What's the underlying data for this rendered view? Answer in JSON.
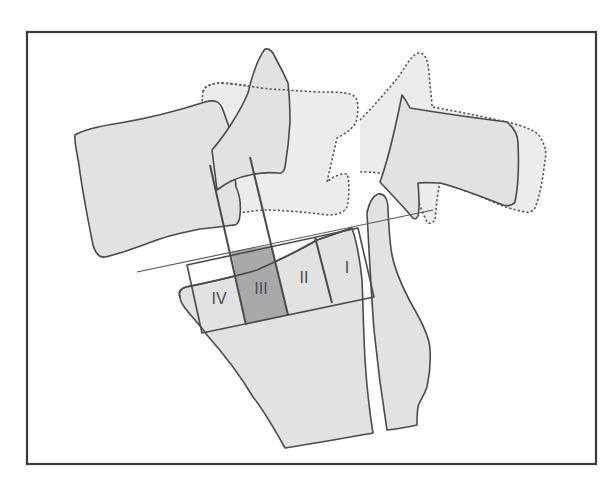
{
  "figure": {
    "type": "anatomical-diagram",
    "colors": {
      "frame": "#3a3a3a",
      "bone_fill": "#e2e2e2",
      "ghost_fill": "#ececec",
      "outline": "#4a4a4a",
      "highlight_zone": "#a9a9a9"
    },
    "zones": [
      {
        "id": "IV",
        "label": "IV",
        "highlighted": false
      },
      {
        "id": "III",
        "label": "III",
        "highlighted": true
      },
      {
        "id": "II",
        "label": "II",
        "highlighted": false
      },
      {
        "id": "I",
        "label": "I",
        "highlighted": false
      }
    ]
  }
}
